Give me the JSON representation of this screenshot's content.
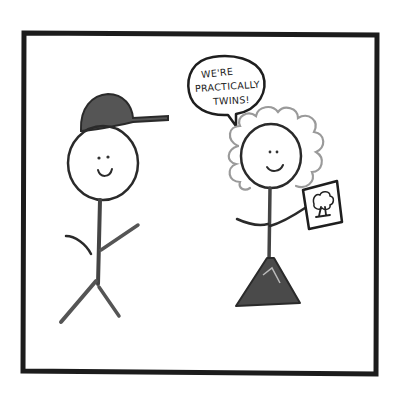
{
  "comic": {
    "type": "single-panel hand-drawn comic",
    "panel": {
      "border_color": "#1c1c1c",
      "background": "#ffffff"
    },
    "speech_bubble": {
      "speaker": "right-figure",
      "lines": [
        "WE'RE",
        "PRACTICALLY",
        "TWINS!"
      ]
    },
    "characters": [
      {
        "id": "left-figure",
        "description": "stick figure with a dark baseball cap, smiling"
      },
      {
        "id": "right-figure",
        "description": "stick figure with curly hair and triangle dress, smiling, holding a sign with a tree drawing"
      }
    ],
    "props": [
      {
        "id": "tree-sign",
        "description": "small rectangular sign with a tree drawing"
      }
    ]
  }
}
